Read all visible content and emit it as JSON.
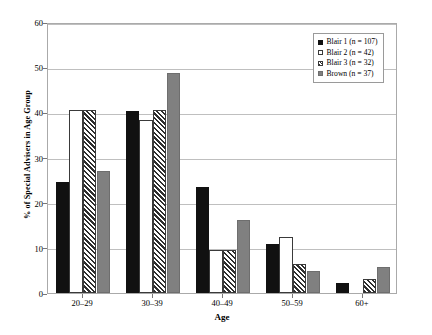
{
  "chart_data": {
    "type": "bar",
    "title": "",
    "xlabel": "Age",
    "ylabel": "% of Special Advisers in Age Group",
    "categories": [
      "20–29",
      "30–39",
      "40–49",
      "50–59",
      "60+"
    ],
    "ylim": [
      0,
      60
    ],
    "yticks": [
      0,
      10,
      20,
      30,
      40,
      50,
      60
    ],
    "grid": true,
    "legend_position": "top-right",
    "series": [
      {
        "name": "Blair 1 (n = 107)",
        "swatch": "filled-black-square",
        "values": [
          24.5,
          40.3,
          23.5,
          10.8,
          2.3
        ]
      },
      {
        "name": "Blair 2 (n = 42)",
        "swatch": "open-white-square",
        "values": [
          40.5,
          38.3,
          9.5,
          12.4,
          0
        ]
      },
      {
        "name": "Blair 3 (n = 32)",
        "swatch": "hatched-square",
        "values": [
          40.5,
          40.5,
          9.5,
          6.5,
          3.2
        ]
      },
      {
        "name": "Brown (n = 37)",
        "swatch": "filled-gray-square",
        "values": [
          27.0,
          48.8,
          16.2,
          4.8,
          5.8
        ]
      }
    ]
  },
  "legend": {
    "entries": [
      "Blair 1 (n = 107)",
      "Blair 2 (n = 42)",
      "Blair 3 (n = 32)",
      "Brown (n = 37)"
    ]
  },
  "axes": {
    "y_title": "% of Special Advisers in Age Group",
    "x_title": "Age",
    "y_tick_labels": [
      "0",
      "10",
      "20",
      "30",
      "40",
      "50",
      "60"
    ],
    "x_tick_labels": [
      "20–29",
      "30–39",
      "40–49",
      "50–59",
      "60+"
    ]
  },
  "colors": {
    "series_1": "#111111",
    "series_2": "#ffffff",
    "series_3": "#2e2e2e",
    "series_4": "#808080",
    "grid": "#bfbfbf",
    "frame": "#aaaaaa"
  }
}
